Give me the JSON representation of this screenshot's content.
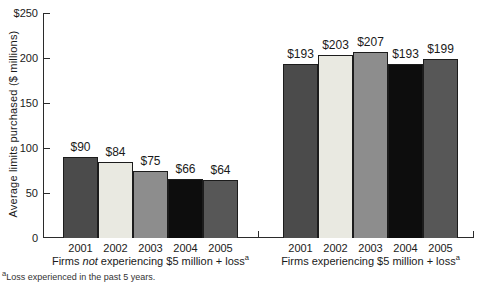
{
  "chart_data": {
    "type": "bar",
    "title": "",
    "xlabel": "",
    "ylabel": "Average limits purchased ($ millions)",
    "ylim": [
      0,
      250
    ],
    "grid": false,
    "legend_position": "none",
    "yticks": [
      {
        "value": 250,
        "label": "$250"
      },
      {
        "value": 200,
        "label": "200"
      },
      {
        "value": 150,
        "label": "150"
      },
      {
        "value": 100,
        "label": "100"
      },
      {
        "value": 50,
        "label": "50"
      },
      {
        "value": 0,
        "label": "0"
      }
    ],
    "categories": [
      "2001",
      "2002",
      "2003",
      "2004",
      "2005"
    ],
    "bar_colors_by_year": [
      "#4b4b4b",
      "#e9e9e1",
      "#8d8d8d",
      "#0d0d0d",
      "#575757"
    ],
    "bar_border_color": "#1c1c1c",
    "groups": [
      {
        "name": "Firms not experiencing $5 million + loss",
        "label_parts": [
          {
            "text": "Firms "
          },
          {
            "text": "not",
            "italic": true
          },
          {
            "text": " experiencing $5 million + loss"
          },
          {
            "text": "a",
            "sup": true
          }
        ],
        "years": [
          "2001",
          "2002",
          "2003",
          "2004",
          "2005"
        ],
        "values": [
          90,
          84,
          75,
          66,
          64
        ],
        "value_labels": [
          "$90",
          "$84",
          "$75",
          "$66",
          "$64"
        ]
      },
      {
        "name": "Firms experiencing $5 million + loss",
        "label_parts": [
          {
            "text": "Firms experiencing $5 million + loss"
          },
          {
            "text": "a",
            "sup": true
          }
        ],
        "years": [
          "2001",
          "2002",
          "2003",
          "2004",
          "2005"
        ],
        "values": [
          193,
          203,
          207,
          193,
          199
        ],
        "value_labels": [
          "$193",
          "$203",
          "$207",
          "$193",
          "$199"
        ]
      }
    ]
  },
  "footnote": {
    "sup": "a",
    "text": "Loss experienced in the past 5 years."
  }
}
